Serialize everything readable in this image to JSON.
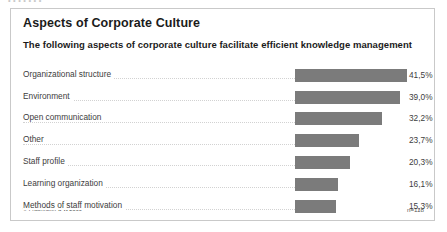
{
  "top_bleed_text": "• •          •                                                                                              •      •              •    •",
  "panel": {
    "title": "Aspects of Corporate Culture",
    "subtitle": "The following aspects of corporate culture facilitate efficient knowledge management",
    "copyright": "© Fraunhofer ",
    "copyright_bold": "IPK",
    "copyright_year": " 2000",
    "sample_note": "n=118"
  },
  "colors": {
    "bar": "#7b7b7b",
    "panel_border": "#c9c9c9",
    "leader": "#d2d2d2",
    "title_text": "#1b1b1b",
    "body_text": "#3d3d3d",
    "background": "#ffffff"
  },
  "chart_data": {
    "type": "bar",
    "orientation": "horizontal",
    "title": "Aspects of Corporate Culture",
    "subtitle": "The following aspects of corporate culture facilitate efficient knowledge management",
    "xlabel": "",
    "ylabel": "",
    "xlim": [
      0,
      45
    ],
    "grid": false,
    "legend": false,
    "sample_size": "n=118",
    "value_suffix": "%",
    "decimal_separator": ",",
    "categories": [
      "Organizational structure",
      "Environment",
      "Open communication",
      "Other",
      "Staff profile",
      "Learning organization",
      "Methods of staff motivation"
    ],
    "values": [
      41.5,
      39.0,
      32.2,
      23.7,
      20.3,
      16.1,
      15.3
    ],
    "value_labels": [
      "41,5%",
      "39,0%",
      "32,2%",
      "23,7%",
      "20,3%",
      "16,1%",
      "15,3%"
    ]
  }
}
